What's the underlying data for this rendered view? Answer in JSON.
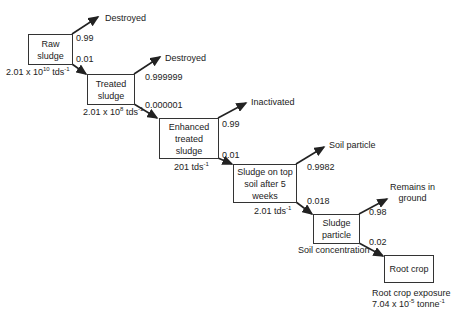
{
  "diagram": {
    "nodes": [
      {
        "id": "raw",
        "label_lines": [
          "Raw",
          "sludge"
        ],
        "below": {
          "base": "2.01 x 10",
          "exp": "10",
          "unit": " tds",
          "unit_exp": "-1"
        }
      },
      {
        "id": "treated",
        "label_lines": [
          "Treated",
          "sludge"
        ],
        "below": {
          "base": "2.01 x 10",
          "exp": "8",
          "unit": " tds",
          "unit_exp": "-1"
        }
      },
      {
        "id": "enhanced",
        "label_lines": [
          "Enhanced",
          "treated",
          "sludge"
        ],
        "below": {
          "base": "201",
          "exp": "",
          "unit": " tds",
          "unit_exp": "-1"
        }
      },
      {
        "id": "topsoil",
        "label_lines": [
          "Sludge on top",
          "soil after 5",
          "weeks"
        ],
        "below": {
          "base": "2.01",
          "exp": "",
          "unit": " tds",
          "unit_exp": "-1"
        }
      },
      {
        "id": "particle",
        "label_lines": [
          "Sludge",
          "particle"
        ],
        "below": {
          "text": "Soil concentration"
        }
      },
      {
        "id": "rootcrop",
        "label_lines": [
          "Root crop"
        ],
        "below": {
          "line1": "Root crop exposure",
          "base": "7.04 x 10",
          "exp": "-5",
          "unit": " tonne",
          "unit_exp": "-1"
        }
      }
    ],
    "branches": [
      {
        "from": "raw",
        "up_label": "Destroyed",
        "up_prob": "0.99",
        "down_prob": "0.01"
      },
      {
        "from": "treated",
        "up_label": "Destroyed",
        "up_prob": "0.999999",
        "down_prob": "0.000001"
      },
      {
        "from": "enhanced",
        "up_label": "Inactivated",
        "up_prob": "0.99",
        "down_prob": "0.01"
      },
      {
        "from": "topsoil",
        "up_label": "Soil particle",
        "up_prob": "0.9982",
        "down_prob": "0.018"
      },
      {
        "from": "particle",
        "up_label_lines": [
          "Remains in",
          "ground"
        ],
        "up_prob": "0.98",
        "down_prob": "0.02"
      }
    ]
  }
}
